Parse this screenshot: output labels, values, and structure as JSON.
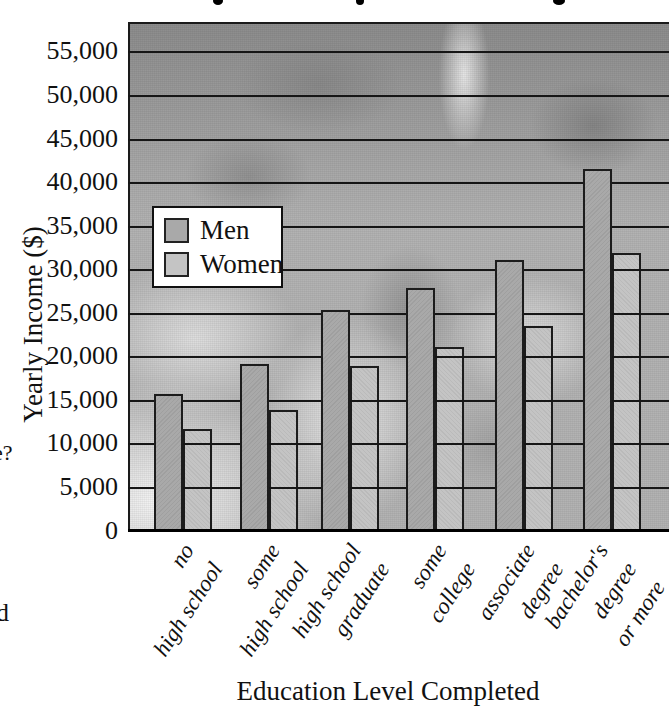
{
  "chart_data": {
    "type": "bar",
    "title": "",
    "xlabel": "Education Level Completed",
    "ylabel": "Yearly Income ($)",
    "ylim": [
      0,
      58000
    ],
    "ytick_interval": 5000,
    "ytick_labels": [
      "0",
      "5,000",
      "10,000",
      "15,000",
      "20,000",
      "25,000",
      "30,000",
      "35,000",
      "40,000",
      "45,000",
      "50,000",
      "55,000"
    ],
    "grid": true,
    "legend_position": "upper left",
    "categories": [
      [
        "no",
        "high school"
      ],
      [
        "some",
        "high school"
      ],
      [
        "high school",
        "graduate"
      ],
      [
        "some",
        "college"
      ],
      [
        "associate",
        "degree"
      ],
      [
        "bachelor's",
        "degree",
        "or more"
      ]
    ],
    "series": [
      {
        "name": "Men",
        "color": "#a9a9a9",
        "values": [
          15800,
          19200,
          25400,
          28000,
          31200,
          41600
        ]
      },
      {
        "name": "Women",
        "color": "#c4c4c4",
        "values": [
          11800,
          14000,
          19000,
          21200,
          23600,
          32000
        ]
      }
    ]
  },
  "colors": {
    "men_bar": "#a9a9a9",
    "women_bar": "#c4c4c4",
    "grid_line": "#161616",
    "photo_base_gray": "#b3b3b3",
    "page_background": "#ffffff"
  },
  "page_edge_fragments": {
    "left_text_fragment_1": "e?",
    "left_text_fragment_2": "d"
  }
}
